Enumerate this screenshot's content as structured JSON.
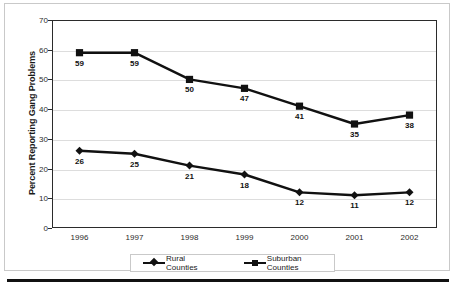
{
  "chart_data": {
    "type": "line",
    "title": "",
    "xlabel": "",
    "ylabel": "Percent Reporting Gang Problems",
    "categories": [
      "1996",
      "1997",
      "1998",
      "1999",
      "2000",
      "2001",
      "2002"
    ],
    "ylim": [
      0,
      70
    ],
    "ytick_values": [
      "0",
      "10",
      "20",
      "30",
      "40",
      "50",
      "60",
      "70"
    ],
    "grid": true,
    "legend_position": "bottom",
    "series": [
      {
        "name": "Rural Counties",
        "marker": "diamond",
        "color": "#111111",
        "values": [
          26,
          25,
          21,
          18,
          12,
          11,
          12
        ],
        "labels": [
          "26",
          "25",
          "21",
          "18",
          "12",
          "11",
          "12"
        ]
      },
      {
        "name": "Suburban Counties",
        "marker": "square",
        "color": "#111111",
        "values": [
          59,
          59,
          50,
          47,
          41,
          35,
          38
        ],
        "labels": [
          "59",
          "59",
          "50",
          "47",
          "41",
          "35",
          "38"
        ]
      }
    ]
  },
  "legend": {
    "entries": [
      {
        "label": "Rural Counties",
        "marker": "diamond-marker-icon"
      },
      {
        "label": "Suburban Counties",
        "marker": "square-marker-icon"
      }
    ]
  },
  "colors": {
    "series": "#111111",
    "grid": "#dddddd",
    "axis": "#2b2b2b",
    "frame": "#c9c9c9",
    "rule": "#111111"
  }
}
